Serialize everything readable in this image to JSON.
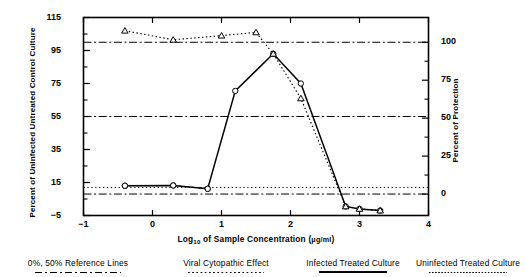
{
  "chart_data": {
    "type": "line",
    "title": "",
    "xlabel": "Log10 of Sample Concentration (ug/ml)",
    "ylabel": "Percent of Uninfected Untreated Control Culture",
    "ylabel_right": "Percent of Protection",
    "xlim": [
      -1,
      4
    ],
    "ylim": [
      -5,
      115
    ],
    "ylim_right": [
      -11.36,
      100.0
    ],
    "grid": false,
    "legend_position": "bottom",
    "xticks": [
      "-1",
      "0",
      "1",
      "2",
      "3",
      "4"
    ],
    "xtick_values": [
      -1,
      0,
      1,
      2,
      3,
      4
    ],
    "yticks_left": [
      "115",
      "95",
      "75",
      "55",
      "35",
      "15",
      "-5"
    ],
    "ytick_left_values": [
      115,
      95,
      75,
      55,
      35,
      15,
      -5
    ],
    "yticks_right": [
      "100",
      "75",
      "50",
      "25",
      "0"
    ],
    "ytick_right_values": [
      100,
      75,
      50,
      25,
      0
    ],
    "reference_lines": [
      {
        "name": "100% protection",
        "style": "dash-dot",
        "y": 100.0
      },
      {
        "name": "50% protection",
        "style": "dash-dot",
        "y": 55.0
      },
      {
        "name": "0% protection",
        "style": "dash-dot",
        "y": 8.0
      },
      {
        "name": "viral cytopathic baseline",
        "style": "dotted",
        "y": 12.0
      }
    ],
    "series": [
      {
        "name": "Viral Cytopathic Effect",
        "style": "dotted",
        "marker": "circle",
        "x": [
          -0.4,
          0.3,
          0.8
        ],
        "y": [
          13.0,
          13.2,
          11.2
        ]
      },
      {
        "name": "Infected Treated Culture",
        "style": "solid",
        "marker": "circle",
        "x": [
          -0.4,
          0.3,
          0.8,
          1.2,
          1.75,
          2.15,
          2.8,
          3.0,
          3.3
        ],
        "y": [
          13.0,
          13.2,
          11.2,
          70.5,
          93.0,
          75.0,
          0.5,
          -1.0,
          -2.0
        ]
      },
      {
        "name": "Uninfected Treated Culture",
        "style": "dotted",
        "marker": "triangle",
        "x": [
          -0.4,
          0.3,
          1.0,
          1.5,
          1.75,
          2.15,
          2.8,
          3.0,
          3.3
        ],
        "y": [
          107.0,
          101.5,
          104.0,
          106.0,
          93.0,
          66.0,
          0.5,
          -1.0,
          -2.0
        ]
      }
    ]
  },
  "axes": {
    "y_left_title": "Percent of Uninfected Untreated Control Culture",
    "y_right_title": "Percent of Protection",
    "x_title_main": "Log",
    "x_title_sub": "10",
    "x_title_rest": " of Sample Concentration (",
    "x_title_unit": "μg/ml",
    "x_title_close": ")"
  },
  "legend": {
    "items": [
      {
        "label": "0%, 50% Reference Lines",
        "style": "dash-dot"
      },
      {
        "label": "Viral Cytopathic Effect",
        "style": "dotted"
      },
      {
        "label": "Infected Treated Culture",
        "style": "solid"
      },
      {
        "label": "Uninfected Treated Culture",
        "style": "fine-dotted"
      }
    ]
  },
  "colors": {
    "ink": "#000000",
    "background": "#ffffff"
  }
}
